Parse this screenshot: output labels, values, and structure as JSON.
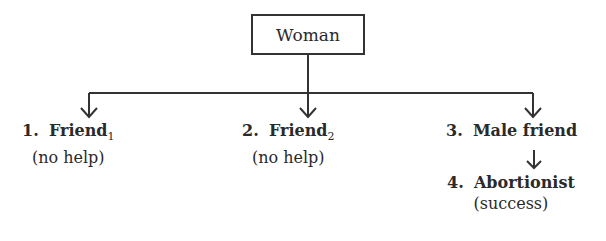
{
  "root": {
    "label": "Woman"
  },
  "nodes": [
    {
      "number": "1.",
      "name": "Friend",
      "subscript": "1",
      "outcome": "(no help)"
    },
    {
      "number": "2.",
      "name": "Friend",
      "subscript": "2",
      "outcome": "(no help)"
    },
    {
      "number": "3.",
      "name": "Male friend",
      "subscript": "",
      "outcome": ""
    },
    {
      "number": "4.",
      "name": "Abortionist",
      "subscript": "",
      "outcome": "(success)"
    }
  ],
  "colors": {
    "line": "#333333",
    "text": "#2a2a2a"
  }
}
